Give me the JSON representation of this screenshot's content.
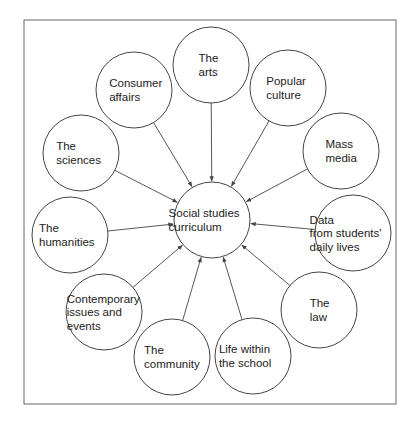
{
  "diagram": {
    "type": "hub-and-spoke",
    "center": {
      "id": "center",
      "lines": [
        "Social studies",
        "curriculum"
      ],
      "cx": 212,
      "cy": 220,
      "r": 38
    },
    "nodes": [
      {
        "id": "arts",
        "lines": [
          "The",
          "arts"
        ],
        "cx": 211,
        "cy": 65,
        "r": 38
      },
      {
        "id": "consumer",
        "lines": [
          "Consumer",
          "affairs"
        ],
        "cx": 134,
        "cy": 90,
        "r": 38
      },
      {
        "id": "popular",
        "lines": [
          "Popular",
          "culture"
        ],
        "cx": 288,
        "cy": 88,
        "r": 38
      },
      {
        "id": "sciences",
        "lines": [
          "The",
          "sciences"
        ],
        "cx": 81,
        "cy": 153,
        "r": 38
      },
      {
        "id": "mass-media",
        "lines": [
          "Mass",
          "media"
        ],
        "cx": 341,
        "cy": 151,
        "r": 38
      },
      {
        "id": "humanities",
        "lines": [
          "The",
          "humanities"
        ],
        "cx": 70,
        "cy": 235,
        "r": 38
      },
      {
        "id": "data",
        "lines": [
          "Data",
          "from students'",
          "daily lives"
        ],
        "cx": 353,
        "cy": 233,
        "r": 38
      },
      {
        "id": "contemporary",
        "lines": [
          "Contemporary",
          "issues and",
          "events"
        ],
        "cx": 104,
        "cy": 312,
        "r": 38
      },
      {
        "id": "law",
        "lines": [
          "The",
          "law"
        ],
        "cx": 319,
        "cy": 310,
        "r": 38
      },
      {
        "id": "community",
        "lines": [
          "The",
          "community"
        ],
        "cx": 172,
        "cy": 357,
        "r": 38
      },
      {
        "id": "life",
        "lines": [
          "Life within",
          "the school"
        ],
        "cx": 253,
        "cy": 356,
        "r": 38
      }
    ],
    "edges_direction": "node-to-center",
    "frame": {
      "x": 24,
      "y": 20,
      "w": 372,
      "h": 384
    },
    "colors": {
      "stroke": "#444444",
      "text": "#222222",
      "bg": "#ffffff"
    }
  }
}
